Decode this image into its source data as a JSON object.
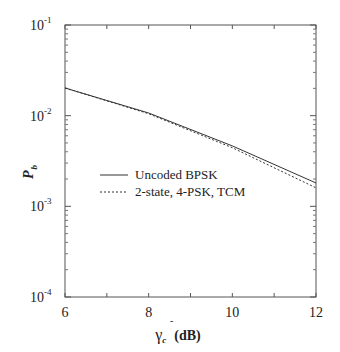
{
  "chart_data": {
    "type": "line",
    "title": "",
    "xlabel": "γ̄c (dB)",
    "xlabel_parts": {
      "symbol": "γ",
      "bar": "-",
      "sub": "c",
      "unit": "(dB)"
    },
    "ylabel": "Pb",
    "ylabel_parts": {
      "main": "P",
      "sub": "b"
    },
    "x_scale": "linear",
    "y_scale": "log",
    "xlim": [
      6,
      12
    ],
    "ylim": [
      0.0001,
      0.1
    ],
    "x_ticks": [
      6,
      8,
      10,
      12
    ],
    "x_tick_labels": [
      "6",
      "8",
      "10",
      "12"
    ],
    "y_ticks": [
      0.1,
      0.01,
      0.001,
      0.0001
    ],
    "y_tick_labels": [
      {
        "base": "10",
        "exp": "-1"
      },
      {
        "base": "10",
        "exp": "-2"
      },
      {
        "base": "10",
        "exp": "-3"
      },
      {
        "base": "10",
        "exp": "-4"
      }
    ],
    "grid": false,
    "legend_position": "inside-left-middle",
    "x": [
      6,
      8,
      10,
      12
    ],
    "series": [
      {
        "name": "Uncoded  BPSK",
        "style": "solid",
        "values": [
          0.0202,
          0.0107,
          0.00464,
          0.00181
        ]
      },
      {
        "name": "2-state, 4-PSK, TCM",
        "style": "dotted",
        "values": [
          0.0202,
          0.0105,
          0.00443,
          0.0016
        ]
      }
    ]
  }
}
